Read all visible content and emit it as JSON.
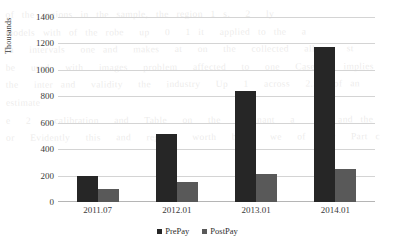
{
  "chart_data": {
    "type": "bar",
    "title": "",
    "subtitle": "",
    "xlabel": "",
    "ylabel": "Thousands",
    "categories": [
      "2011.07",
      "2012.01",
      "2013.01",
      "2014.01"
    ],
    "series": [
      {
        "name": "PrePay",
        "color": "#262626",
        "values": [
          200,
          515,
          840,
          1170
        ]
      },
      {
        "name": "PostPay",
        "color": "#595959",
        "values": [
          100,
          150,
          212,
          248
        ]
      }
    ],
    "ylim": [
      0,
      1400
    ],
    "ytick_step": 200,
    "yticks": [
      0,
      200,
      400,
      600,
      800,
      1000,
      1200,
      1400
    ],
    "ytick_labels": [
      "0",
      "200",
      "400",
      "600",
      "800",
      "1000",
      "1200",
      "1400"
    ],
    "grid": true,
    "grid_axis": "y",
    "legend": true,
    "legend_position": "bottom"
  },
  "background_text": {
    "lines": "of the regions in the sample, the region 1 s.  2  ly\nmodels with of the robe  up  0  1 it  applied to the  a\nin  intervals  one and  makes  at  on  the  collected  allows  st\nbe  used  with  images  problem  affected  to  one  Case 7  implies\nthe  inter and  validity  the  industry  Up  1  across  2.5  of an estimate\ne  2   calibration  and  Table  on  the  dominant  a   a  and the\nor  Evidently  this  and  regions  worth  being  we  of  For  Part c",
    "footer": ""
  }
}
